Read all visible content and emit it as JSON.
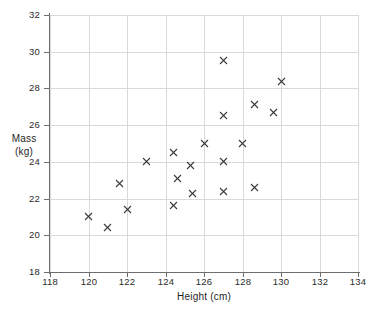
{
  "chart_data": {
    "type": "scatter",
    "title": "",
    "xlabel": "Height (cm)",
    "ylabel_line1": "Mass",
    "ylabel_line2": "(kg)",
    "xlim": [
      118,
      134
    ],
    "ylim": [
      18,
      32
    ],
    "xticks": [
      118,
      120,
      122,
      124,
      126,
      128,
      130,
      132,
      134
    ],
    "yticks": [
      18,
      20,
      22,
      24,
      26,
      28,
      30,
      32
    ],
    "xtick_labels": [
      "118",
      "120",
      "122",
      "124",
      "126",
      "128",
      "130",
      "132",
      "134"
    ],
    "ytick_labels": [
      "18",
      "20",
      "22",
      "24",
      "26",
      "28",
      "30",
      "32"
    ],
    "grid": true,
    "grid_color": "#d9d9d9",
    "axis_color": "#6e6e6e",
    "marker": "x-cross",
    "marker_color": "#3a3a3a",
    "legend": null,
    "points": [
      {
        "x": 120.0,
        "y": 21.0
      },
      {
        "x": 121.0,
        "y": 20.4
      },
      {
        "x": 121.6,
        "y": 22.8
      },
      {
        "x": 122.0,
        "y": 21.4
      },
      {
        "x": 123.0,
        "y": 24.0
      },
      {
        "x": 124.4,
        "y": 24.5
      },
      {
        "x": 124.4,
        "y": 21.6
      },
      {
        "x": 124.6,
        "y": 23.1
      },
      {
        "x": 125.3,
        "y": 23.8
      },
      {
        "x": 125.4,
        "y": 22.3
      },
      {
        "x": 126.0,
        "y": 25.0
      },
      {
        "x": 127.0,
        "y": 29.5
      },
      {
        "x": 127.0,
        "y": 26.5
      },
      {
        "x": 127.0,
        "y": 24.0
      },
      {
        "x": 127.0,
        "y": 22.4
      },
      {
        "x": 128.0,
        "y": 25.0
      },
      {
        "x": 128.6,
        "y": 27.1
      },
      {
        "x": 128.6,
        "y": 22.6
      },
      {
        "x": 129.6,
        "y": 26.7
      },
      {
        "x": 130.0,
        "y": 28.4
      }
    ]
  }
}
